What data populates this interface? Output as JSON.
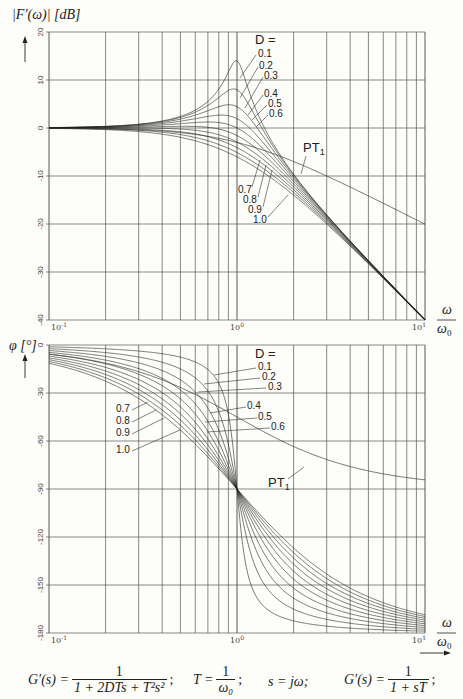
{
  "chart_data": [
    {
      "type": "line",
      "title": "Amplitude response of second-order system (PT2) and PT1",
      "ylabel": "|F'(ω)| [dB]",
      "xlabel": "ω / ω0",
      "xscale": "log",
      "xlim": [
        0.1,
        10
      ],
      "ylim": [
        -40,
        20
      ],
      "yticks": [
        20,
        10,
        0,
        -10,
        -20,
        -30,
        -40
      ],
      "xticks": [
        "10^-1",
        "10^0",
        "10^1"
      ],
      "grid": true,
      "legend_title": "D =",
      "series": [
        {
          "name": "D=0.1",
          "D": 0.1,
          "peak_db": 14.0
        },
        {
          "name": "D=0.2",
          "D": 0.2,
          "peak_db": 8.1
        },
        {
          "name": "D=0.3",
          "D": 0.3,
          "peak_db": 4.8
        },
        {
          "name": "D=0.4",
          "D": 0.4,
          "peak_db": 2.7
        },
        {
          "name": "D=0.5",
          "D": 0.5,
          "peak_db": 1.2
        },
        {
          "name": "D=0.6",
          "D": 0.6,
          "peak_db": 0.4
        },
        {
          "name": "D=0.7",
          "D": 0.7,
          "peak_db": 0.0
        },
        {
          "name": "D=0.8",
          "D": 0.8,
          "peak_db": 0.0
        },
        {
          "name": "D=0.9",
          "D": 0.9,
          "peak_db": 0.0
        },
        {
          "name": "D=1.0",
          "D": 1.0,
          "peak_db": 0.0
        },
        {
          "name": "PT1",
          "type": "first-order",
          "value_at_10_db": -20
        }
      ]
    },
    {
      "type": "line",
      "title": "Phase response of second-order system (PT2) and PT1",
      "ylabel": "φ [°]",
      "xlabel": "ω / ω0",
      "xscale": "log",
      "xlim": [
        0.1,
        10
      ],
      "ylim": [
        -180,
        0
      ],
      "yticks": [
        0,
        -30,
        -60,
        -90,
        -120,
        -150,
        -180
      ],
      "xticks": [
        "10^-1",
        "10^0",
        "10^1"
      ],
      "grid": true,
      "legend_title": "D =",
      "series": [
        {
          "name": "D=0.1",
          "D": 0.1
        },
        {
          "name": "D=0.2",
          "D": 0.2
        },
        {
          "name": "D=0.3",
          "D": 0.3
        },
        {
          "name": "D=0.4",
          "D": 0.4
        },
        {
          "name": "D=0.5",
          "D": 0.5
        },
        {
          "name": "D=0.6",
          "D": 0.6
        },
        {
          "name": "D=0.7",
          "D": 0.7
        },
        {
          "name": "D=0.8",
          "D": 0.8
        },
        {
          "name": "D=0.9",
          "D": 0.9
        },
        {
          "name": "D=1.0",
          "D": 1.0
        },
        {
          "name": "PT1",
          "type": "first-order",
          "value_at_1_deg": -45,
          "value_at_10_deg": -84
        }
      ]
    }
  ],
  "top": {
    "ylabel": "|F′(ω)| [dB]",
    "yticks": [
      "20",
      "10",
      "0",
      "-10",
      "-20",
      "-30",
      "-40"
    ],
    "legend_title": "D =",
    "labels_right": [
      "0.1",
      "0.2",
      "0.3",
      "0.4",
      "0.5",
      "0.6"
    ],
    "labels_left": [
      "0.7",
      "0.8",
      "0.9",
      "1.0"
    ],
    "pt1_label": "PT",
    "pt1_sub": "1"
  },
  "bottom": {
    "ylabel": "φ [°]",
    "yticks": [
      "0",
      "-30",
      "-60",
      "-90",
      "-120",
      "-150",
      "-180"
    ],
    "legend_title": "D =",
    "labels_right": [
      "0.1",
      "0.2",
      "0.3",
      "0.4",
      "0.5",
      "0.6"
    ],
    "labels_left": [
      "0.7",
      "0.8",
      "0.9",
      "1.0"
    ],
    "pt1_label": "PT",
    "pt1_sub": "1"
  },
  "xaxis": {
    "ticks": [
      "10",
      "10",
      "10"
    ],
    "exps": [
      "-1",
      "0",
      "1"
    ],
    "label_num": "ω",
    "label_den": "ω",
    "label_den_sub": "0"
  },
  "formulas": {
    "f1_lhs": "G′(s) =",
    "f1_num": "1",
    "f1_den": "1 + 2DTs + T²s²",
    "f2_lhs": "T =",
    "f2_num": "1",
    "f2_den": "ω₀",
    "f3": "s = jω;",
    "f4_lhs": "G′(s) =",
    "f4_num": "1",
    "f4_den": "1 + sT"
  },
  "colors": {
    "background": "#fdfdfa",
    "ink": "#222222",
    "grid": "#555555"
  }
}
